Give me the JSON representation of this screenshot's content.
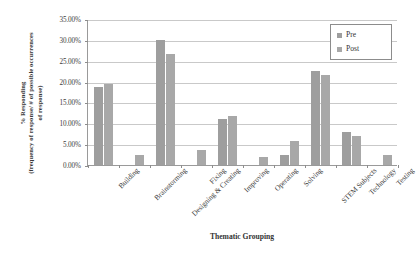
{
  "chart_data": {
    "type": "bar",
    "title": "",
    "xlabel": "Thematic Grouping",
    "ylabel": "% Responding (frequency of response/ # of possible occurrences of response)",
    "ylabel_lines": [
      "% Responding",
      "(frequency of response/ # of possible occurrences",
      "of response)"
    ],
    "categories": [
      "Building",
      "Brainstorming",
      "Designing & Creating",
      "Fixing",
      "Improving",
      "Operating",
      "Solving",
      "STEM Subjects",
      "Technology",
      "Testing"
    ],
    "series": [
      {
        "name": "Pre",
        "color": "#9e9e9e",
        "values": [
          18.8,
          0.0,
          30.0,
          0.0,
          11.0,
          0.0,
          2.3,
          22.5,
          8.0,
          0.0
        ]
      },
      {
        "name": "Post",
        "color": "#a8a8a8",
        "values": [
          19.5,
          2.3,
          26.7,
          3.5,
          11.8,
          2.0,
          5.8,
          21.5,
          7.0,
          2.3
        ]
      }
    ],
    "ylim": [
      0,
      35
    ],
    "ytick_values": [
      0,
      5,
      10,
      15,
      20,
      25,
      30,
      35
    ],
    "ytick_labels": [
      "0.00%",
      "5.00%",
      "10.00%",
      "15.00%",
      "20.00%",
      "25.00%",
      "30.00%",
      "35.00%"
    ],
    "grid": true,
    "legend_position": "top-right",
    "legend_entries": [
      "Pre",
      "Post"
    ]
  }
}
